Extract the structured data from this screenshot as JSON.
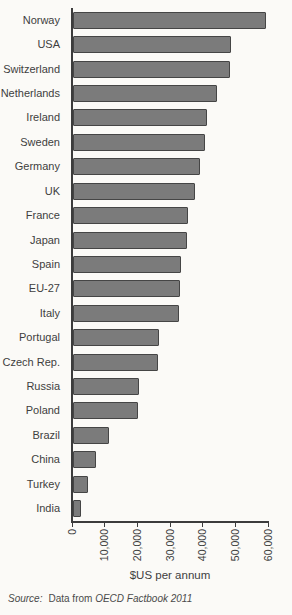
{
  "figure": {
    "xlabel": "$US per annum",
    "source": {
      "prefix": "Source:",
      "body": "Data from",
      "ref": "OECD Factbook 2011"
    }
  },
  "chart_data": {
    "type": "bar",
    "orientation": "horizontal",
    "title": "",
    "xlabel": "$US per annum",
    "ylabel": "",
    "xlim": [
      0,
      60000
    ],
    "x_ticks": [
      0,
      10000,
      20000,
      30000,
      40000,
      50000,
      60000
    ],
    "x_tick_labels": [
      "0",
      "10,000",
      "20,000",
      "30,000",
      "40,000",
      "50,000",
      "60,000"
    ],
    "grid": false,
    "legend": false,
    "bar_color": "#7b7b7b",
    "bar_border_color": "#454545",
    "axis_color": "#3c3c3c",
    "categories": [
      "Norway",
      "USA",
      "Switzerland",
      "Netherlands",
      "Ireland",
      "Sweden",
      "Germany",
      "UK",
      "France",
      "Japan",
      "Spain",
      "EU-27",
      "Italy",
      "Portugal",
      "Czech Rep.",
      "Russia",
      "Poland",
      "Brazil",
      "China",
      "Turkey",
      "India"
    ],
    "values": [
      59000,
      48500,
      48200,
      44100,
      41100,
      40500,
      38800,
      37200,
      35200,
      34900,
      33000,
      32700,
      32400,
      26200,
      25900,
      20100,
      19800,
      10900,
      7000,
      4600,
      2600
    ],
    "source": "Source: Data from OECD Factbook 2011"
  }
}
